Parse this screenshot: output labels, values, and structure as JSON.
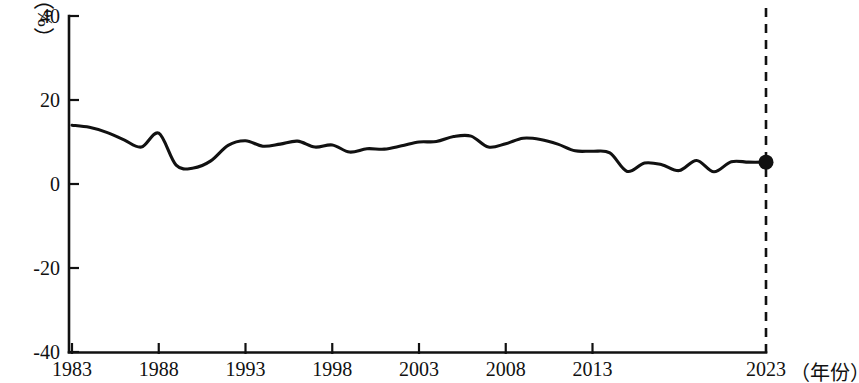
{
  "chart_data": {
    "type": "line",
    "title": "",
    "subtitle": "",
    "xlabel": "（年份）",
    "ylabel": "（%）",
    "ylim": [
      -40,
      40
    ],
    "xlim": [
      1983,
      2023
    ],
    "yticks": [
      "40",
      "20",
      "0",
      "-20",
      "-40"
    ],
    "ytick_values": [
      40,
      20,
      0,
      -20,
      -40
    ],
    "xticks": [
      "1983",
      "1988",
      "1993",
      "1998",
      "2003",
      "2008",
      "2013",
      "2023"
    ],
    "xtick_values": [
      1983,
      1988,
      1993,
      1998,
      2003,
      2008,
      2013,
      2023
    ],
    "grid": false,
    "legend": "none",
    "series": [
      {
        "name": "",
        "x": [
          1983,
          1984,
          1985,
          1986,
          1987,
          1988,
          1989,
          1990,
          1991,
          1992,
          1993,
          1994,
          1995,
          1996,
          1997,
          1998,
          1999,
          2000,
          2001,
          2002,
          2003,
          2004,
          2005,
          2006,
          2007,
          2008,
          2009,
          2010,
          2011,
          2012,
          2013,
          2014,
          2015,
          2016,
          2017,
          2018,
          2019,
          2020,
          2021,
          2022,
          2023
        ],
        "values": [
          14.0,
          13.5,
          12.3,
          10.5,
          8.8,
          12.1,
          4.5,
          3.8,
          5.5,
          9.2,
          10.3,
          9.0,
          9.5,
          10.2,
          8.8,
          9.3,
          7.6,
          8.4,
          8.3,
          9.1,
          10.0,
          10.1,
          11.3,
          11.4,
          8.8,
          9.6,
          10.9,
          10.6,
          9.5,
          7.9,
          7.8,
          7.4,
          3.0,
          5.0,
          4.6,
          3.2,
          5.6,
          2.9,
          5.3,
          5.2,
          5.2
        ]
      }
    ],
    "annotations": [
      {
        "name": "endpoint-marker",
        "kind": "point-marker",
        "x": 2023,
        "y": 5.2
      },
      {
        "name": "projection-divider",
        "kind": "vertical-dashed-line",
        "x": 2023
      }
    ],
    "axis_unit_top_left": "（%）",
    "axis_unit_bottom_right": "（年份）"
  },
  "geometry": {
    "plot_left_px": 72,
    "plot_right_px": 766,
    "plot_top_px": 16,
    "plot_bottom_px": 352,
    "px_per_year": 17.35,
    "px_per_unit": 4.2,
    "zero_y_px": 184
  }
}
